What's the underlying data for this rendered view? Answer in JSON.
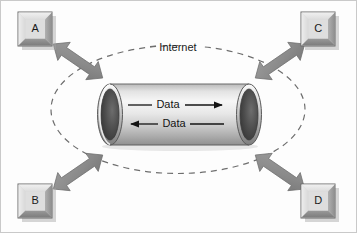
{
  "diagram": {
    "frame": {
      "border_color": "#c9c9c9",
      "background_color": "#fdfdfd",
      "width": 357,
      "height": 233
    },
    "cloud": {
      "label": "Internet",
      "shape": "dashed-ellipse",
      "stroke_color": "#6e6e6e",
      "dash_pattern": "6 5"
    },
    "tunnel": {
      "shape": "cylinder",
      "body_color_light": "#f2f2f2",
      "body_color_mid": "#d0d0d0",
      "body_color_dark": "#9a9a9a",
      "opening_color": "#3c3c3c",
      "outline_color": "#4a4a4a",
      "flows": [
        {
          "label": "Data",
          "direction": "right"
        },
        {
          "label": "Data",
          "direction": "left"
        }
      ]
    },
    "nodes": [
      {
        "id": "node-a",
        "label": "A",
        "position": "top-left"
      },
      {
        "id": "node-c",
        "label": "C",
        "position": "top-right"
      },
      {
        "id": "node-b",
        "label": "B",
        "position": "bottom-left"
      },
      {
        "id": "node-d",
        "label": "D",
        "position": "bottom-right"
      }
    ],
    "node_style": {
      "face_color": "#d9d9d9",
      "bevel_light": "#efefef",
      "bevel_dark": "#8f8f8f",
      "outline_color": "#6b6b6b",
      "shadow_color": "#9e9e9e"
    },
    "connectors": [
      {
        "id": "connector-a",
        "from": "node-a",
        "to": "tunnel",
        "type": "double-arrow",
        "orientation": "diagonal-nw-se"
      },
      {
        "id": "connector-c",
        "from": "node-c",
        "to": "tunnel",
        "type": "double-arrow",
        "orientation": "diagonal-ne-sw"
      },
      {
        "id": "connector-b",
        "from": "node-b",
        "to": "tunnel",
        "type": "double-arrow",
        "orientation": "diagonal-sw-ne"
      },
      {
        "id": "connector-d",
        "from": "node-d",
        "to": "tunnel",
        "type": "double-arrow",
        "orientation": "diagonal-se-nw"
      }
    ],
    "connector_style": {
      "fill_color": "#8b8b8b",
      "stroke_color": "#6f6f6f"
    }
  }
}
